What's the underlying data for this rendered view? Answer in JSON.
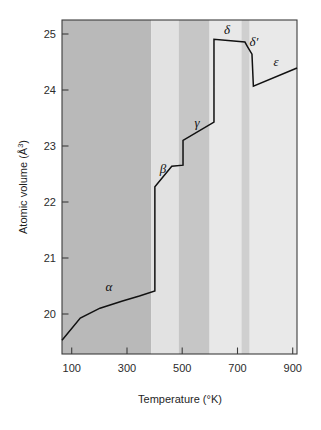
{
  "chart_data": {
    "type": "line",
    "title": "",
    "xlabel": "Temperature (°K)",
    "ylabel": "Atomic volume (Å³)",
    "ylabel_main": "Atomic volume (Å",
    "ylabel_sup": "3",
    "ylabel_close": ")",
    "xlabel_main": "Temperature (°K)",
    "xlim": [
      65,
      900
    ],
    "ylim": [
      19.3,
      25.35
    ],
    "grid": false,
    "legend": "none",
    "xticks": [
      100,
      300,
      500,
      700,
      900
    ],
    "xtick_labels": [
      "100",
      "300",
      "500",
      "700",
      "900"
    ],
    "yticks": [
      20,
      21,
      22,
      23,
      24,
      25
    ],
    "ytick_labels": [
      "20",
      "21",
      "22",
      "23",
      "24",
      "25"
    ],
    "series": [
      {
        "name": "alpha",
        "points": [
          [
            65,
            19.55
          ],
          [
            130,
            19.95
          ],
          [
            200,
            20.13
          ],
          [
            280,
            20.26
          ],
          [
            340,
            20.35
          ],
          [
            395,
            20.44
          ]
        ]
      },
      {
        "name": "beta",
        "points": [
          [
            395,
            22.33
          ],
          [
            455,
            22.7
          ],
          [
            495,
            22.72
          ]
        ]
      },
      {
        "name": "gamma",
        "points": [
          [
            495,
            23.17
          ],
          [
            605,
            23.5
          ]
        ]
      },
      {
        "name": "delta",
        "points": [
          [
            605,
            25.0
          ],
          [
            715,
            24.95
          ],
          [
            725,
            24.86
          ]
        ]
      },
      {
        "name": "delta-prime",
        "points": [
          [
            725,
            24.86
          ],
          [
            740,
            24.73
          ],
          [
            745,
            24.15
          ]
        ]
      },
      {
        "name": "epsilon",
        "points": [
          [
            745,
            24.15
          ],
          [
            900,
            24.48
          ]
        ]
      }
    ],
    "vertical_transitions": [
      {
        "x": 395,
        "y_from": 20.44,
        "y_to": 22.33,
        "name": "alpha-to-beta"
      },
      {
        "x": 495,
        "y_from": 22.72,
        "y_to": 23.17,
        "name": "beta-to-gamma"
      },
      {
        "x": 605,
        "y_from": 23.5,
        "y_to": 25.0,
        "name": "gamma-to-delta"
      }
    ],
    "phase_bands": [
      {
        "name": "alpha",
        "x_start": 65,
        "x_end": 395,
        "color": "#b9b9b9"
      },
      {
        "name": "beta",
        "x_start": 395,
        "x_end": 495,
        "color": "#e2e2e2"
      },
      {
        "name": "gamma",
        "x_start": 495,
        "x_end": 607,
        "color": "#c6c6c6"
      },
      {
        "name": "delta",
        "x_start": 607,
        "x_end": 722,
        "color": "#e8e8e8"
      },
      {
        "name": "delta-prime",
        "x_start": 722,
        "x_end": 752,
        "color": "#cfcfcf"
      },
      {
        "name": "epsilon",
        "x_start": 752,
        "x_end": 900,
        "color": "#e9e9e9"
      }
    ],
    "annotations": [
      {
        "name": "alpha-label",
        "text": "α",
        "x": 235,
        "y": 20.49
      },
      {
        "name": "beta-label",
        "text": "β",
        "x": 430,
        "y": 23.0
      },
      {
        "name": "gamma-label",
        "text": "γ",
        "x": 555,
        "y": 23.82
      },
      {
        "name": "delta-label",
        "text": "δ",
        "x": 662,
        "y": 25.27
      },
      {
        "name": "delta-prime-label",
        "text": "δ′",
        "x": 757,
        "y": 25.06
      },
      {
        "name": "epsilon-label",
        "text": "ε",
        "x": 835,
        "y": 24.7
      }
    ]
  },
  "colors": {
    "curve": "#111111",
    "frame": "#3c3c3c",
    "tick": "#3c3c3c",
    "text": "#1f1f1f",
    "page_background": "#ffffff"
  }
}
